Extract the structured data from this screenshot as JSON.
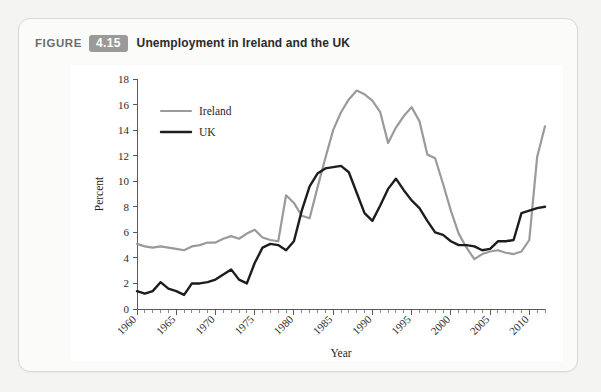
{
  "figure": {
    "label": "FIGURE",
    "number": "4.15",
    "caption": "Unemployment in Ireland and the UK"
  },
  "chart_data": {
    "type": "line",
    "title": "Unemployment in Ireland and the UK",
    "xlabel": "Year",
    "ylabel": "Percent",
    "xlim": [
      1960,
      2012
    ],
    "ylim": [
      0,
      18
    ],
    "ytick_step": 2,
    "yticks": [
      0,
      2,
      4,
      6,
      8,
      10,
      12,
      14,
      16,
      18
    ],
    "xticks": [
      1960,
      1965,
      1970,
      1975,
      1980,
      1985,
      1990,
      1995,
      2000,
      2005,
      2010
    ],
    "xtick_labels": [
      "1960",
      "1965",
      "1970",
      "1975",
      "1980",
      "1985",
      "1990",
      "1995",
      "2000",
      "2005",
      "2010"
    ],
    "xtick_minor_step": 1,
    "xtick_label_rotation": -45,
    "grid": false,
    "legend_position": "upper-left-inside",
    "x": [
      1960,
      1961,
      1962,
      1963,
      1964,
      1965,
      1966,
      1967,
      1968,
      1969,
      1970,
      1971,
      1972,
      1973,
      1974,
      1975,
      1976,
      1977,
      1978,
      1979,
      1980,
      1981,
      1982,
      1983,
      1984,
      1985,
      1986,
      1987,
      1988,
      1989,
      1990,
      1991,
      1992,
      1993,
      1994,
      1995,
      1996,
      1997,
      1998,
      1999,
      2000,
      2001,
      2002,
      2003,
      2004,
      2005,
      2006,
      2007,
      2008,
      2009,
      2010,
      2011,
      2012
    ],
    "series": [
      {
        "name": "Ireland",
        "color": "#9a9a9a",
        "width": 2.2,
        "values": [
          5.1,
          4.9,
          4.8,
          4.9,
          4.8,
          4.7,
          4.6,
          4.9,
          5.0,
          5.2,
          5.2,
          5.5,
          5.7,
          5.5,
          5.9,
          6.2,
          5.6,
          5.4,
          5.3,
          8.9,
          8.3,
          7.3,
          7.1,
          9.5,
          11.8,
          14.0,
          15.4,
          16.4,
          17.1,
          16.8,
          16.3,
          15.4,
          13.0,
          14.2,
          15.1,
          15.8,
          14.7,
          12.1,
          11.8,
          9.8,
          7.7,
          5.9,
          4.8,
          3.9,
          4.3,
          4.5,
          4.6,
          4.4,
          4.3,
          4.5,
          5.4,
          11.9,
          14.3
        ]
      },
      {
        "name": "UK",
        "color": "#1d1d1d",
        "width": 2.4,
        "values": [
          1.4,
          1.2,
          1.4,
          2.1,
          1.6,
          1.4,
          1.1,
          2.0,
          2.0,
          2.1,
          2.3,
          2.7,
          3.1,
          2.3,
          2.0,
          3.6,
          4.8,
          5.1,
          5.0,
          4.6,
          5.3,
          7.7,
          9.6,
          10.6,
          11.0,
          11.1,
          11.2,
          10.7,
          9.1,
          7.5,
          6.9,
          8.1,
          9.4,
          10.2,
          9.3,
          8.5,
          7.9,
          6.9,
          6.0,
          5.8,
          5.3,
          5.0,
          5.0,
          4.9,
          4.6,
          4.7,
          5.3,
          5.3,
          5.4,
          7.5,
          7.7,
          7.9,
          8.0
        ]
      }
    ]
  },
  "legend": {
    "items": [
      {
        "label": "Ireland",
        "color": "#9a9a9a"
      },
      {
        "label": "UK",
        "color": "#1d1d1d"
      }
    ]
  }
}
